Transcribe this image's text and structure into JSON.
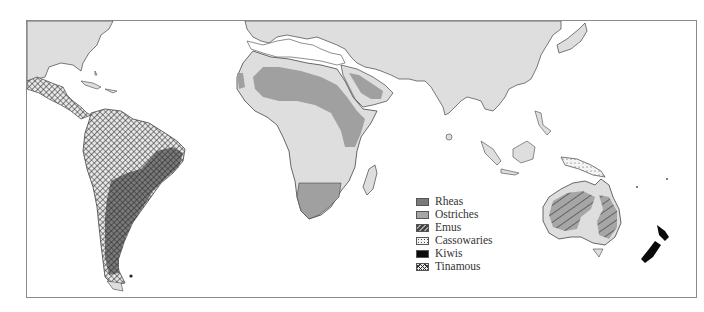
{
  "map": {
    "title": "",
    "subject": "Distribution of ratite birds and tinamous",
    "colors": {
      "land": "#dedede",
      "coast": "#444444",
      "rheas": "#7a7a7a",
      "ostriches": "#a6a6a6",
      "emus_bg": "#a6a6a6",
      "emus_hatch": "#555555",
      "cassowaries_dots": "#555555",
      "kiwis": "#0a0a0a",
      "tinamous_hatch": "#333333",
      "frame": "#8a8a8a"
    },
    "regions": [
      {
        "name": "North America",
        "species": []
      },
      {
        "name": "Central America",
        "species": [
          "Tinamous"
        ]
      },
      {
        "name": "South America",
        "species": [
          "Tinamous",
          "Rheas"
        ]
      },
      {
        "name": "North Africa / Sahel",
        "species": [
          "Ostriches"
        ]
      },
      {
        "name": "Arabian Peninsula",
        "species": [
          "Ostriches"
        ]
      },
      {
        "name": "Southern Africa",
        "species": [
          "Ostriches"
        ]
      },
      {
        "name": "New Guinea",
        "species": [
          "Cassowaries"
        ]
      },
      {
        "name": "Australia",
        "species": [
          "Emus",
          "Cassowaries"
        ]
      },
      {
        "name": "New Zealand",
        "species": [
          "Kiwis"
        ]
      }
    ]
  },
  "legend": {
    "items": [
      {
        "label": "Rheas",
        "pattern": "solid-dark-gray"
      },
      {
        "label": "Ostriches",
        "pattern": "solid-light-gray"
      },
      {
        "label": "Emus",
        "pattern": "diagonal-hatch"
      },
      {
        "label": "Cassowaries",
        "pattern": "dots"
      },
      {
        "label": "Kiwis",
        "pattern": "solid-black"
      },
      {
        "label": "Tinamous",
        "pattern": "crosshatch"
      }
    ]
  }
}
